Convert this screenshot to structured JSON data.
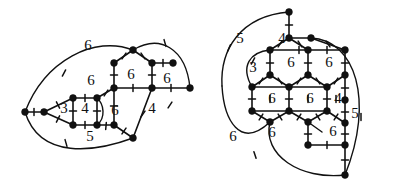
{
  "figure": {
    "background_color": "#ffffff",
    "ink_color": "#111111",
    "node_radius": 3.4,
    "tick_length": 7
  },
  "panels": [
    {
      "id": "left-panel",
      "name": "left-graph",
      "face_labels": [
        {
          "text": "6",
          "x": 88,
          "y": 47
        },
        {
          "text": "6",
          "x": 91,
          "y": 82
        },
        {
          "text": "6",
          "x": 131,
          "y": 76
        },
        {
          "text": "6",
          "x": 167,
          "y": 80
        },
        {
          "text": "3",
          "x": 64,
          "y": 110
        },
        {
          "text": "4",
          "x": 85,
          "y": 110
        },
        {
          "text": "6",
          "x": 115,
          "y": 112
        },
        {
          "text": "4",
          "x": 152,
          "y": 110
        },
        {
          "text": "5",
          "x": 90,
          "y": 138
        }
      ],
      "nodes": [
        {
          "x": 25,
          "y": 112
        },
        {
          "x": 44,
          "y": 112
        },
        {
          "x": 73,
          "y": 98
        },
        {
          "x": 97,
          "y": 98
        },
        {
          "x": 73,
          "y": 125
        },
        {
          "x": 97,
          "y": 125
        },
        {
          "x": 114,
          "y": 63
        },
        {
          "x": 114,
          "y": 88
        },
        {
          "x": 133,
          "y": 50
        },
        {
          "x": 152,
          "y": 63
        },
        {
          "x": 152,
          "y": 88
        },
        {
          "x": 173,
          "y": 63
        },
        {
          "x": 190,
          "y": 88
        },
        {
          "x": 133,
          "y": 138
        },
        {
          "x": 114,
          "y": 125
        }
      ],
      "straight_edges": [
        [
          25,
          112,
          44,
          112
        ],
        [
          44,
          112,
          73,
          98
        ],
        [
          44,
          112,
          73,
          125
        ],
        [
          73,
          98,
          97,
          98
        ],
        [
          73,
          98,
          73,
          125
        ],
        [
          73,
          125,
          97,
          125
        ],
        [
          97,
          98,
          97,
          125
        ],
        [
          97,
          98,
          114,
          88
        ],
        [
          97,
          125,
          114,
          125
        ],
        [
          114,
          63,
          114,
          88
        ],
        [
          114,
          63,
          133,
          50
        ],
        [
          133,
          50,
          152,
          63
        ],
        [
          152,
          63,
          152,
          88
        ],
        [
          152,
          63,
          173,
          63
        ],
        [
          114,
          88,
          152,
          88
        ],
        [
          152,
          88,
          190,
          88
        ],
        [
          114,
          125,
          133,
          138
        ],
        [
          114,
          88,
          114,
          125
        ],
        [
          152,
          88,
          133,
          138
        ]
      ],
      "arcs": [
        {
          "d": "M 25 112 C 45 60, 95 35, 133 50",
          "name": "outer-arc-top"
        },
        {
          "d": "M 133 50 C 160 34, 186 48, 190 88",
          "name": "outer-arc-right"
        },
        {
          "d": "M 25 112 C 40 160, 95 152, 133 138",
          "name": "outer-arc-bottom"
        },
        {
          "d": "M 97 98 C 104 104, 106 118, 97 125",
          "name": "inner-hex-left"
        }
      ],
      "ticks": [
        {
          "x": 34,
          "y": 112,
          "angle": 90
        },
        {
          "x": 58,
          "y": 105,
          "angle": 63
        },
        {
          "x": 58,
          "y": 119,
          "angle": 117
        },
        {
          "x": 85,
          "y": 98,
          "angle": 90
        },
        {
          "x": 73,
          "y": 111,
          "angle": 0
        },
        {
          "x": 85,
          "y": 125,
          "angle": 90
        },
        {
          "x": 97,
          "y": 111,
          "angle": 0
        },
        {
          "x": 106,
          "y": 93,
          "angle": 122
        },
        {
          "x": 106,
          "y": 126,
          "angle": 95
        },
        {
          "x": 114,
          "y": 75,
          "angle": 0
        },
        {
          "x": 124,
          "y": 56,
          "angle": 124
        },
        {
          "x": 143,
          "y": 56,
          "angle": 56
        },
        {
          "x": 152,
          "y": 75,
          "angle": 0
        },
        {
          "x": 163,
          "y": 63,
          "angle": 90
        },
        {
          "x": 133,
          "y": 88,
          "angle": 90
        },
        {
          "x": 171,
          "y": 88,
          "angle": 90
        },
        {
          "x": 124,
          "y": 131,
          "angle": 125
        },
        {
          "x": 143,
          "y": 114,
          "angle": 125
        },
        {
          "x": 114,
          "y": 106,
          "angle": 0
        },
        {
          "x": 64,
          "y": 73,
          "angle": 118
        },
        {
          "x": 165,
          "y": 43,
          "angle": 74
        },
        {
          "x": 66,
          "y": 143,
          "angle": 74
        },
        {
          "x": 170,
          "y": 105,
          "angle": 123
        }
      ]
    },
    {
      "id": "right-panel",
      "name": "right-graph",
      "face_labels": [
        {
          "text": "5",
          "x": 240,
          "y": 40
        },
        {
          "text": "4",
          "x": 282,
          "y": 40
        },
        {
          "text": "3",
          "x": 253,
          "y": 69
        },
        {
          "text": "6",
          "x": 291,
          "y": 64
        },
        {
          "text": "6",
          "x": 329,
          "y": 64
        },
        {
          "text": "6",
          "x": 272,
          "y": 100
        },
        {
          "text": "6",
          "x": 310,
          "y": 100
        },
        {
          "text": "4",
          "x": 338,
          "y": 100
        },
        {
          "text": "5",
          "x": 355,
          "y": 115
        },
        {
          "text": "6",
          "x": 233,
          "y": 138
        },
        {
          "text": "6",
          "x": 272,
          "y": 134
        },
        {
          "text": "6",
          "x": 333,
          "y": 133
        }
      ],
      "nodes": [
        {
          "x": 289,
          "y": 12
        },
        {
          "x": 289,
          "y": 38
        },
        {
          "x": 311,
          "y": 38
        },
        {
          "x": 270,
          "y": 50
        },
        {
          "x": 270,
          "y": 75
        },
        {
          "x": 308,
          "y": 50
        },
        {
          "x": 308,
          "y": 75
        },
        {
          "x": 345,
          "y": 50
        },
        {
          "x": 345,
          "y": 75
        },
        {
          "x": 252,
          "y": 87
        },
        {
          "x": 252,
          "y": 111
        },
        {
          "x": 289,
          "y": 87
        },
        {
          "x": 289,
          "y": 111
        },
        {
          "x": 327,
          "y": 87
        },
        {
          "x": 327,
          "y": 111
        },
        {
          "x": 345,
          "y": 100
        },
        {
          "x": 345,
          "y": 123
        },
        {
          "x": 270,
          "y": 122
        },
        {
          "x": 308,
          "y": 122
        },
        {
          "x": 308,
          "y": 145
        },
        {
          "x": 345,
          "y": 145
        },
        {
          "x": 345,
          "y": 175
        }
      ],
      "straight_edges": [
        [
          289,
          12,
          289,
          38
        ],
        [
          289,
          38,
          311,
          38
        ],
        [
          289,
          38,
          270,
          50
        ],
        [
          289,
          38,
          308,
          50
        ],
        [
          270,
          50,
          270,
          75
        ],
        [
          270,
          50,
          308,
          50
        ],
        [
          308,
          50,
          308,
          75
        ],
        [
          311,
          38,
          345,
          50
        ],
        [
          345,
          50,
          345,
          75
        ],
        [
          308,
          50,
          345,
          50
        ],
        [
          270,
          75,
          252,
          87
        ],
        [
          270,
          75,
          289,
          87
        ],
        [
          308,
          75,
          289,
          87
        ],
        [
          308,
          75,
          327,
          87
        ],
        [
          345,
          75,
          327,
          87
        ],
        [
          252,
          87,
          252,
          111
        ],
        [
          289,
          87,
          289,
          111
        ],
        [
          327,
          87,
          327,
          111
        ],
        [
          345,
          75,
          345,
          100
        ],
        [
          252,
          111,
          270,
          122
        ],
        [
          289,
          111,
          270,
          122
        ],
        [
          289,
          111,
          308,
          122
        ],
        [
          327,
          111,
          308,
          122
        ],
        [
          327,
          111,
          345,
          123
        ],
        [
          345,
          100,
          345,
          123
        ],
        [
          308,
          122,
          308,
          145
        ],
        [
          308,
          145,
          345,
          145
        ],
        [
          345,
          123,
          345,
          145
        ],
        [
          345,
          145,
          345,
          175
        ],
        [
          252,
          87,
          289,
          87
        ],
        [
          289,
          87,
          327,
          87
        ],
        [
          252,
          111,
          289,
          111
        ],
        [
          289,
          111,
          327,
          111
        ]
      ],
      "arcs": [
        {
          "d": "M 289 12 C 240 16, 220 50, 222 86",
          "name": "outer-arc-left-upper"
        },
        {
          "d": "M 222 86 C 224 120, 240 150, 270 122",
          "name": "outer-arc-left-lower"
        },
        {
          "d": "M 270 50 C 250 52, 240 66, 252 87",
          "name": "inner-arc-3face"
        },
        {
          "d": "M 270 122 C 262 155, 300 180, 345 175",
          "name": "outer-arc-bottom"
        },
        {
          "d": "M 311 38 C 355 40, 375 100, 345 175",
          "name": "outer-arc-right"
        },
        {
          "d": "M 308 122 L 322 132",
          "name": "short-stub-diagonal"
        }
      ],
      "ticks": [
        {
          "x": 289,
          "y": 25,
          "angle": 0
        },
        {
          "x": 300,
          "y": 44,
          "angle": 58
        },
        {
          "x": 280,
          "y": 44,
          "angle": 122
        },
        {
          "x": 299,
          "y": 50,
          "angle": 90
        },
        {
          "x": 270,
          "y": 63,
          "angle": 0
        },
        {
          "x": 308,
          "y": 63,
          "angle": 0
        },
        {
          "x": 327,
          "y": 50,
          "angle": 90
        },
        {
          "x": 345,
          "y": 63,
          "angle": 0
        },
        {
          "x": 328,
          "y": 44,
          "angle": 56
        },
        {
          "x": 261,
          "y": 81,
          "angle": 122
        },
        {
          "x": 280,
          "y": 81,
          "angle": 58
        },
        {
          "x": 299,
          "y": 81,
          "angle": 122
        },
        {
          "x": 318,
          "y": 81,
          "angle": 58
        },
        {
          "x": 336,
          "y": 81,
          "angle": 122
        },
        {
          "x": 252,
          "y": 99,
          "angle": 0
        },
        {
          "x": 289,
          "y": 99,
          "angle": 0
        },
        {
          "x": 327,
          "y": 99,
          "angle": 0
        },
        {
          "x": 345,
          "y": 88,
          "angle": 0
        },
        {
          "x": 270,
          "y": 99,
          "angle": 90
        },
        {
          "x": 308,
          "y": 99,
          "angle": 90
        },
        {
          "x": 336,
          "y": 99,
          "angle": 90
        },
        {
          "x": 261,
          "y": 117,
          "angle": 122
        },
        {
          "x": 280,
          "y": 117,
          "angle": 58
        },
        {
          "x": 299,
          "y": 117,
          "angle": 122
        },
        {
          "x": 318,
          "y": 117,
          "angle": 58
        },
        {
          "x": 336,
          "y": 117,
          "angle": 122
        },
        {
          "x": 345,
          "y": 112,
          "angle": 0
        },
        {
          "x": 308,
          "y": 134,
          "angle": 0
        },
        {
          "x": 327,
          "y": 145,
          "angle": 90
        },
        {
          "x": 345,
          "y": 134,
          "angle": 0
        },
        {
          "x": 345,
          "y": 160,
          "angle": 0
        },
        {
          "x": 229,
          "y": 48,
          "angle": 114
        },
        {
          "x": 253,
          "y": 61,
          "angle": 118
        },
        {
          "x": 255,
          "y": 155,
          "angle": 72
        },
        {
          "x": 361,
          "y": 117,
          "angle": 90
        }
      ]
    }
  ]
}
